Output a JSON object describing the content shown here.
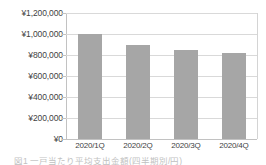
{
  "chart_data": {
    "type": "bar",
    "title": "",
    "xlabel": "",
    "ylabel": "",
    "categories": [
      "2020/1Q",
      "2020/2Q",
      "2020/3Q",
      "2020/4Q"
    ],
    "values": [
      1000000,
      900000,
      850000,
      820000
    ],
    "series": [
      {
        "name": "",
        "values": [
          1000000,
          900000,
          850000,
          820000
        ]
      }
    ],
    "ylim": [
      0,
      1200000
    ],
    "ytick_values": [
      0,
      200000,
      400000,
      600000,
      800000,
      1000000,
      1200000
    ],
    "ytick_labels": [
      "¥0",
      "¥200,000",
      "¥400,000",
      "¥600,000",
      "¥800,000",
      "¥1,000,000",
      "¥1,200,000"
    ],
    "currency_symbol": "¥",
    "grid": true,
    "grid_axis": "y",
    "legend": false,
    "legend_position": "none",
    "bar_color": "#a6a6a6",
    "gridline_color": "#d9d9d9",
    "axis_color": "#c2c2c2",
    "text_color": "#3f3f3f",
    "background_color": "#ffffff"
  },
  "caption": {
    "text": "図1 一戸当たり平均支出金額(四半期別/円)"
  }
}
